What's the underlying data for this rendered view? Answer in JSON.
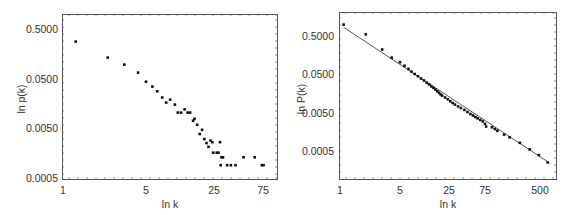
{
  "chart_data": [
    {
      "type": "scatter",
      "title": "",
      "xlabel": "ln k",
      "ylabel": "ln p(k)",
      "xscale": "log",
      "yscale": "log",
      "xticks": [
        "1",
        "5",
        "25",
        "75"
      ],
      "yticks": [
        "0.5000",
        "0.0500",
        "0.0050",
        "0.0005"
      ],
      "xlim": [
        1,
        110
      ],
      "ylim": [
        0.0005,
        1.0
      ],
      "grid": false,
      "legend": null,
      "series": [
        {
          "name": "p(k)",
          "points": [
            [
              1.3,
              0.28
            ],
            [
              2.4,
              0.134
            ],
            [
              3.3,
              0.097
            ],
            [
              4.3,
              0.067
            ],
            [
              5.0,
              0.044
            ],
            [
              5.8,
              0.035
            ],
            [
              6.5,
              0.028
            ],
            [
              7.3,
              0.021
            ],
            [
              8.0,
              0.0165
            ],
            [
              8.8,
              0.019
            ],
            [
              9.8,
              0.015
            ],
            [
              10.5,
              0.0103
            ],
            [
              11.3,
              0.0103
            ],
            [
              12.3,
              0.012
            ],
            [
              13.2,
              0.0103
            ],
            [
              14.0,
              0.0103
            ],
            [
              15.0,
              0.007
            ],
            [
              15.5,
              0.0077
            ],
            [
              16.5,
              0.0058
            ],
            [
              17.5,
              0.0038
            ],
            [
              18.5,
              0.0046
            ],
            [
              19.5,
              0.003
            ],
            [
              20.5,
              0.0025
            ],
            [
              21.5,
              0.0021
            ],
            [
              22.5,
              0.0028
            ],
            [
              23.5,
              0.0026
            ],
            [
              24.0,
              0.0016
            ],
            [
              26.0,
              0.0016
            ],
            [
              27.0,
              0.0016
            ],
            [
              28.0,
              0.0026
            ],
            [
              29.0,
              0.0013
            ],
            [
              30.0,
              0.0013
            ],
            [
              28.5,
              0.0009
            ],
            [
              33.0,
              0.0009
            ],
            [
              36.0,
              0.0009
            ],
            [
              40.0,
              0.0009
            ],
            [
              48.0,
              0.0013
            ],
            [
              62.0,
              0.0013
            ],
            [
              73.0,
              0.0009
            ],
            [
              76.0,
              0.0009
            ]
          ]
        }
      ]
    },
    {
      "type": "scatter",
      "title": "",
      "xlabel": "ln k",
      "ylabel": "ln P(k)",
      "xscale": "log",
      "yscale": "log",
      "xticks": [
        "1",
        "5",
        "25",
        "75",
        "500"
      ],
      "yticks": [
        "0.5000",
        "0.0500",
        "0.0050",
        "0.0005"
      ],
      "xlim": [
        1,
        800
      ],
      "ylim": [
        0.00013,
        1.5
      ],
      "grid": false,
      "legend": null,
      "fit_line": {
        "from": [
          1.1,
          0.85
        ],
        "to": [
          700,
          0.00024
        ]
      },
      "series": [
        {
          "name": "P(k)",
          "points": [
            [
              1.1,
              1.0
            ],
            [
              2.0,
              0.55
            ],
            [
              3.1,
              0.22
            ],
            [
              4.0,
              0.135
            ],
            [
              5.0,
              0.102
            ],
            [
              5.8,
              0.082
            ],
            [
              6.6,
              0.068
            ],
            [
              7.3,
              0.058
            ],
            [
              8.1,
              0.05
            ],
            [
              9.0,
              0.044
            ],
            [
              10.0,
              0.038
            ],
            [
              11.0,
              0.034
            ],
            [
              12.0,
              0.03
            ],
            [
              13.0,
              0.027
            ],
            [
              14.0,
              0.024
            ],
            [
              15.0,
              0.022
            ],
            [
              16.0,
              0.02
            ],
            [
              17.0,
              0.018
            ],
            [
              18.0,
              0.0165
            ],
            [
              19.0,
              0.015
            ],
            [
              20.0,
              0.014
            ],
            [
              22.0,
              0.0125
            ],
            [
              24.0,
              0.0112
            ],
            [
              26.0,
              0.01
            ],
            [
              28.0,
              0.009
            ],
            [
              30.0,
              0.0082
            ],
            [
              33.0,
              0.0074
            ],
            [
              36.0,
              0.0067
            ],
            [
              40.0,
              0.006
            ],
            [
              44.0,
              0.0053
            ],
            [
              48.0,
              0.0047
            ],
            [
              52.0,
              0.0043
            ],
            [
              56.0,
              0.0039
            ],
            [
              60.0,
              0.0036
            ],
            [
              65.0,
              0.0033
            ],
            [
              70.0,
              0.003
            ],
            [
              75.0,
              0.0026
            ],
            [
              78.0,
              0.0022
            ],
            [
              95.0,
              0.0021
            ],
            [
              105.0,
              0.0019
            ],
            [
              115.0,
              0.0017
            ],
            [
              145.0,
              0.00135
            ],
            [
              175.0,
              0.00115
            ],
            [
              250.0,
              0.00082
            ],
            [
              350.0,
              0.00055
            ],
            [
              480.0,
              0.00039
            ],
            [
              650.0,
              0.00025
            ]
          ]
        }
      ]
    }
  ],
  "charts": {
    "left": {
      "ylabel": "ln p(k)",
      "xlabel": "ln k",
      "yticks": [
        "0.5000",
        "0.0500",
        "0.0050",
        "0.0005"
      ],
      "xticks": [
        "1",
        "5",
        "25",
        "75"
      ]
    },
    "right": {
      "ylabel": "ln P(k)",
      "xlabel": "ln k",
      "yticks": [
        "0.5000",
        "0.0500",
        "0.0050",
        "0.0005"
      ],
      "xticks": [
        "1",
        "5",
        "25",
        "75",
        "500"
      ]
    }
  }
}
